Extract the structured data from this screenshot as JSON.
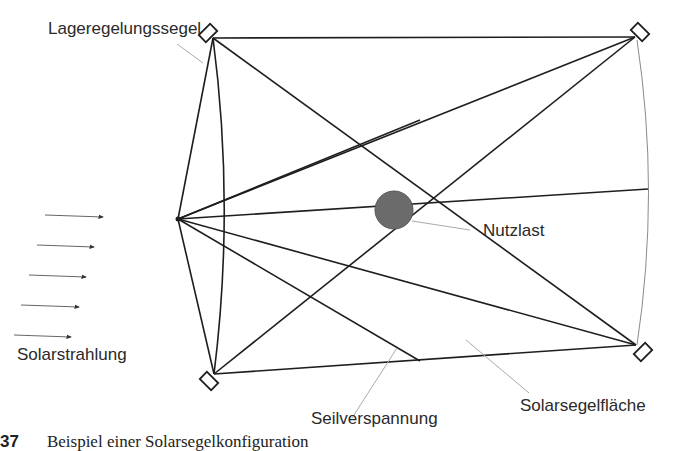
{
  "diagram": {
    "type": "solar-sail-configuration",
    "labels": {
      "attitude_sail": "Lageregelungssegel",
      "payload": "Nutzlast",
      "solar_radiation": "Solarstrahlung",
      "rigging": "Seilverspannung",
      "sail_surface": "Solarsegelfläche"
    },
    "caption": {
      "number": "37",
      "text": "Beispiel einer Solarsegelkonfiguration"
    },
    "colors": {
      "line": "#1e1e1e",
      "leader": "#aaaaaa",
      "payload_fill": "#6b6b6b",
      "text": "#2a2a2a"
    },
    "nodes": {
      "hub": [
        178,
        219
      ],
      "payload": [
        394,
        210
      ],
      "sail_top_left": [
        213,
        38
      ],
      "sail_top_right": [
        635,
        37
      ],
      "sail_bottom_left": [
        214,
        374
      ],
      "sail_bottom_right": [
        636,
        345
      ]
    },
    "radiation_arrows": 5
  }
}
